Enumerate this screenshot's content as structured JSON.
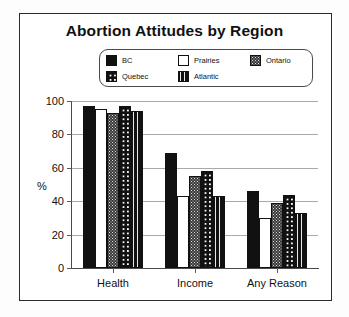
{
  "chart_data": {
    "type": "bar",
    "title": "Abortion Attitudes by Region",
    "xlabel": "",
    "ylabel": "%",
    "ylim": [
      0,
      100
    ],
    "yticks": [
      0,
      20,
      40,
      60,
      80,
      100
    ],
    "grid": true,
    "legend_position": "top-center",
    "categories": [
      "Health",
      "Income",
      "Any Reason"
    ],
    "series": [
      {
        "name": "BC",
        "pattern": "solid-black",
        "values": [
          97,
          69,
          46
        ]
      },
      {
        "name": "Prairies",
        "pattern": "white",
        "values": [
          95,
          43,
          30
        ]
      },
      {
        "name": "Ontario",
        "pattern": "dark-speckle",
        "values": [
          93,
          55,
          39
        ]
      },
      {
        "name": "Quebec",
        "pattern": "checkered",
        "values": [
          97,
          58,
          44
        ]
      },
      {
        "name": "Atlantic",
        "pattern": "vertical-stripe",
        "values": [
          94,
          43,
          33
        ]
      }
    ]
  },
  "legend": {
    "rows": [
      [
        {
          "label": "BC",
          "pattern": "solid-black"
        },
        {
          "label": "Prairies",
          "pattern": "white"
        },
        {
          "label": "Ontario",
          "pattern": "dark-speckle"
        }
      ],
      [
        {
          "label": "Quebec",
          "pattern": "checkered"
        },
        {
          "label": "Atlantic",
          "pattern": "vertical-stripe"
        },
        {
          "label": "",
          "pattern": "blank"
        }
      ]
    ]
  },
  "colors": {
    "frame": "#2b2b2b",
    "gridline": "#a9a9a9",
    "axis": "#4a4a4a",
    "bar_outline": "#111111",
    "background": "#ffffff",
    "text": "#111111"
  }
}
